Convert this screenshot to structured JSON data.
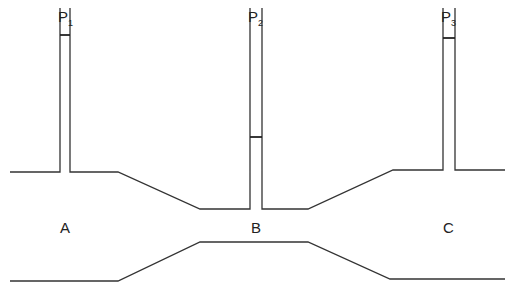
{
  "diagram": {
    "gauges": [
      {
        "label": "P",
        "subscript": "1",
        "x": 65,
        "meniscus_y": 35
      },
      {
        "label": "P",
        "subscript": "2",
        "x": 256,
        "meniscus_y": 137
      },
      {
        "label": "P",
        "subscript": "3",
        "x": 449,
        "meniscus_y": 38
      }
    ],
    "sections": [
      {
        "label": "A",
        "x": 65,
        "y": 233
      },
      {
        "label": "B",
        "x": 256,
        "y": 233
      },
      {
        "label": "C",
        "x": 448,
        "y": 233
      }
    ],
    "colors": {
      "line": "#333333",
      "background": "#ffffff"
    }
  }
}
